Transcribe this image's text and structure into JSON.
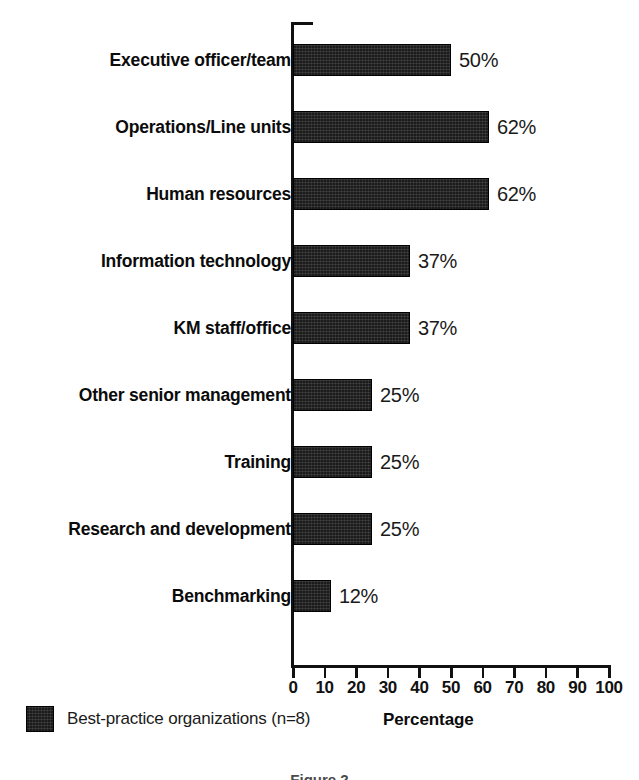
{
  "chart_data": {
    "type": "bar",
    "orientation": "horizontal",
    "title": "",
    "xlabel": "Percentage",
    "ylabel": "",
    "xlim": [
      0,
      100
    ],
    "grid": false,
    "legend_position": "bottom-left",
    "categories": [
      "Executive officer/team",
      "Operations/Line units",
      "Human resources",
      "Information technology",
      "KM staff/office",
      "Other senior management",
      "Training",
      "Research and development",
      "Benchmarking"
    ],
    "values": [
      50,
      62,
      62,
      37,
      37,
      25,
      25,
      25,
      12
    ],
    "value_labels": [
      "50%",
      "62%",
      "62%",
      "37%",
      "37%",
      "25%",
      "25%",
      "25%",
      "12%"
    ],
    "xticks": [
      0,
      10,
      20,
      30,
      40,
      50,
      60,
      70,
      80,
      90,
      100
    ],
    "xtick_labels": [
      "0",
      "10",
      "20",
      "30",
      "40",
      "50",
      "60",
      "70",
      "80",
      "90",
      "100"
    ],
    "series": [
      {
        "name": "Best-practice organizations (n=8)",
        "color": "#1b1b1b",
        "values": [
          50,
          62,
          62,
          37,
          37,
          25,
          25,
          25,
          12
        ]
      }
    ]
  },
  "legend": {
    "label": "Best-practice organizations (n=8)",
    "swatch_color": "#1b1b1b"
  },
  "axis": {
    "x_title": "Percentage",
    "axis_color": "#111111"
  },
  "caption": {
    "fragment": "Figure 2"
  }
}
